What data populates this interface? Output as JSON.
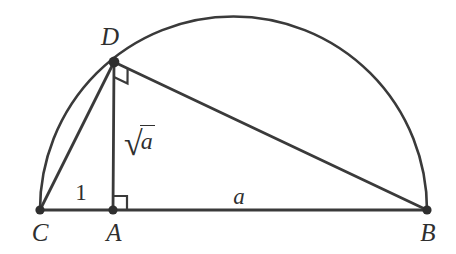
{
  "figure": {
    "kind": "geometric-mean-semicircle",
    "background_color": "#ffffff",
    "stroke_color": "#3a3a3a",
    "label_color": "#2f2f2f",
    "vertex_dot_color": "#2f2f2f"
  },
  "points": {
    "C": {
      "label": "C",
      "x": 40,
      "y": 210,
      "label_x": 40,
      "label_y": 232
    },
    "A": {
      "label": "A",
      "x": 113,
      "y": 210,
      "label_x": 114,
      "label_y": 232
    },
    "B": {
      "label": "B",
      "x": 427,
      "y": 210,
      "label_x": 428,
      "label_y": 232
    },
    "D": {
      "label": "D",
      "x": 114,
      "y": 62,
      "label_x": 110,
      "label_y": 36
    }
  },
  "segments": [
    {
      "name": "segment-CB",
      "from": "C",
      "to": "B"
    },
    {
      "name": "segment-CD",
      "from": "C",
      "to": "D"
    },
    {
      "name": "segment-DB",
      "from": "D",
      "to": "B"
    },
    {
      "name": "segment-DA",
      "from": "D",
      "to": "A"
    }
  ],
  "arc": {
    "name": "semicircle-arc-CB",
    "center_x": 233.5,
    "center_y": 210,
    "radius": 193.5,
    "from": "C",
    "to": "B"
  },
  "right_angles": [
    {
      "name": "right-angle-at-A",
      "at": "A",
      "size": 14
    },
    {
      "name": "right-angle-at-D",
      "at": "D",
      "size": 15
    }
  ],
  "length_labels": {
    "ca": {
      "text": "1",
      "x": 81,
      "y": 192,
      "italic": false
    },
    "ab": {
      "text": "a",
      "x": 239,
      "y": 196,
      "italic": true
    },
    "ad_radical": "√",
    "ad_radicand": "a",
    "ad_x": 124,
    "ad_y": 126
  }
}
